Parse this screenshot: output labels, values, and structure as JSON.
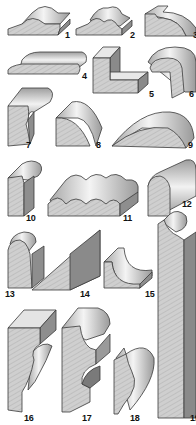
{
  "figure": {
    "colors": {
      "end_grain": "#c9c9c9",
      "face_light": "#f2f2f2",
      "face_mid": "#b8b8b8",
      "face_dark": "#8a8a8a",
      "outline": "#3a3a3a",
      "label": "#111111"
    },
    "items": [
      {
        "number": "1",
        "x": 65,
        "y": 36
      },
      {
        "number": "2",
        "x": 130,
        "y": 36
      },
      {
        "number": "3",
        "x": 192,
        "y": 36
      },
      {
        "number": "4",
        "x": 82,
        "y": 75
      },
      {
        "number": "5",
        "x": 148,
        "y": 89
      },
      {
        "number": "6",
        "x": 189,
        "y": 89
      },
      {
        "number": "7",
        "x": 26,
        "y": 142
      },
      {
        "number": "8",
        "x": 97,
        "y": 142
      },
      {
        "number": "9",
        "x": 188,
        "y": 142
      },
      {
        "number": "10",
        "x": 26,
        "y": 213
      },
      {
        "number": "11",
        "x": 123,
        "y": 213
      },
      {
        "number": "12",
        "x": 182,
        "y": 200
      },
      {
        "number": "13",
        "x": 4,
        "y": 289
      },
      {
        "number": "14",
        "x": 80,
        "y": 289
      },
      {
        "number": "15",
        "x": 145,
        "y": 289
      },
      {
        "number": "16",
        "x": 24,
        "y": 413
      },
      {
        "number": "17",
        "x": 82,
        "y": 413
      },
      {
        "number": "18",
        "x": 130,
        "y": 413
      },
      {
        "number": "19",
        "x": 190,
        "y": 413
      }
    ]
  }
}
